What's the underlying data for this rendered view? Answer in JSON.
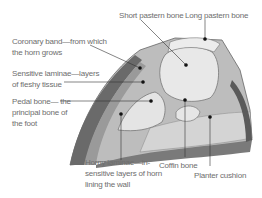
{
  "diagram": {
    "labels": {
      "short_pastern": "Short pastern bone",
      "long_pastern": "Long pastern bone",
      "coronary_band_1": "Coronary band—from which",
      "coronary_band_2": "the horn grows",
      "sensitive_laminae_1": "Sensitive laminae—layers",
      "sensitive_laminae_2": "of fleshy tissue",
      "pedal_bone_1": "Pedal bone— the",
      "pedal_bone_2": "principal bone of",
      "pedal_bone_3": "the foot",
      "horny_laminae_1": "Horny laminae—in-",
      "horny_laminae_2": "sensitive layers of horn",
      "horny_laminae_3": "lining the wall",
      "coffin_bone": "Coffin bone",
      "planter_cushion": "Planter cushion"
    },
    "colors": {
      "text": "#6e6e6e",
      "lines": "#333333",
      "hoof_dark": "#555555",
      "bone": "#e8e8e8"
    }
  }
}
